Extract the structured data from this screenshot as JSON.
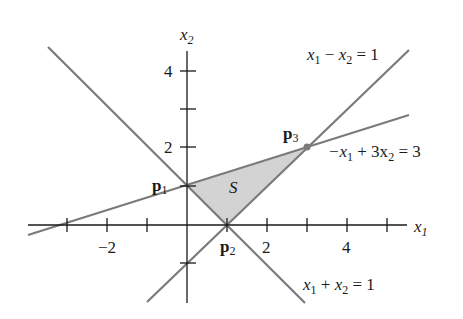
{
  "diagram": {
    "type": "linear-inequalities-feasible-region",
    "axes": {
      "x_label": "x",
      "x_label_sub": "1",
      "y_label": "x",
      "y_label_sub": "2",
      "x_tick_labels": [
        {
          "value": -2,
          "text": "−2"
        },
        {
          "value": 2,
          "text": "2"
        },
        {
          "value": 4,
          "text": "4"
        }
      ],
      "y_tick_labels": [
        {
          "value": 2,
          "text": "2"
        },
        {
          "value": 4,
          "text": "4"
        }
      ],
      "x_ticks": [
        -3,
        -2,
        -1,
        1,
        2,
        3,
        4,
        5
      ],
      "y_ticks": [
        -1,
        1,
        2,
        3,
        4
      ],
      "x_range": [
        -4,
        5.5
      ],
      "y_range": [
        -2.2,
        5
      ]
    },
    "lines": [
      {
        "name": "x1-minus-x2",
        "eq_parts": [
          "x",
          "1",
          " − ",
          "x",
          "2",
          " = 1"
        ],
        "label": "x1 − x2 = 1"
      },
      {
        "name": "neg-x1-plus-3x2",
        "eq_parts": [
          "−x",
          "1",
          " + 3x",
          "2",
          " = 3"
        ],
        "label": "−x1 + 3x2 = 3"
      },
      {
        "name": "x1-plus-x2",
        "eq_parts": [
          "x",
          "1",
          " + ",
          "x",
          "2",
          " = 1"
        ],
        "label": "x1 + x2 = 1"
      }
    ],
    "points": [
      {
        "name": "p1",
        "label": "p",
        "sub": "1",
        "coords": [
          0,
          1
        ]
      },
      {
        "name": "p2",
        "label": "p",
        "sub": "2",
        "coords": [
          1,
          0
        ]
      },
      {
        "name": "p3",
        "label": "p",
        "sub": "3",
        "coords": [
          3,
          2
        ]
      }
    ],
    "region": {
      "label": "S",
      "vertices": [
        [
          0,
          1
        ],
        [
          1,
          0
        ],
        [
          3,
          2
        ]
      ]
    },
    "colors": {
      "axis": "#1a1a1a",
      "line": "#7a7a7a",
      "region_fill": "#d3d3d3",
      "point": "#7a7a7a"
    }
  }
}
